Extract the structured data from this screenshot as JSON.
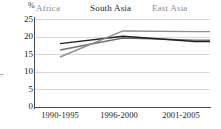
{
  "chart_data": {
    "type": "line",
    "title": "",
    "xlabel": "",
    "ylabel": "%",
    "ylim": [
      0,
      25
    ],
    "ytick_labels": [
      "25",
      "20",
      "15",
      "10",
      "5",
      "0"
    ],
    "ytick_values": [
      25,
      20,
      15,
      10,
      5,
      0
    ],
    "grid": true,
    "legend_position": "top",
    "categories": [
      "1990-1995",
      "1996-2000",
      "2001-2005"
    ],
    "series": [
      {
        "name": "Africa",
        "values": [
          16.2,
          19.6,
          19.0
        ],
        "color": "#6f6f6f"
      },
      {
        "name": "South Asia",
        "values": [
          18.0,
          20.1,
          18.6
        ],
        "color": "#1f1f1f"
      },
      {
        "name": "East Asia",
        "values": [
          14.2,
          21.6,
          21.4
        ],
        "color": "#8f8f8f"
      }
    ]
  },
  "axis": {
    "percent_symbol": "%"
  }
}
